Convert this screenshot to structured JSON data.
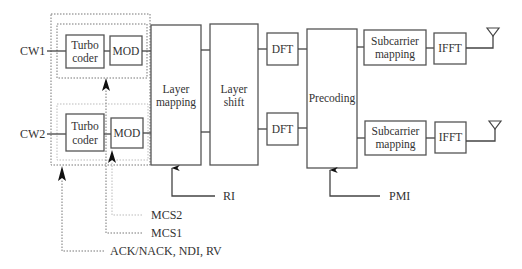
{
  "inputs": {
    "cw1": "CW1",
    "cw2": "CW2"
  },
  "blocks": {
    "turbo1": [
      "Turbo",
      "coder"
    ],
    "mod1": "MOD",
    "turbo2": [
      "Turbo",
      "coder"
    ],
    "mod2": "MOD",
    "layer_mapping": [
      "Layer",
      "mapping"
    ],
    "layer_shift": [
      "Layer",
      "shift"
    ],
    "dft1": "DFT",
    "dft2": "DFT",
    "precoding": "Precoding",
    "subcarrier1": [
      "Subcarrier",
      "mapping"
    ],
    "subcarrier2": [
      "Subcarrier",
      "mapping"
    ],
    "ifft1": "IFFT",
    "ifft2": "IFFT"
  },
  "control": {
    "ri": "RI",
    "pmi": "PMI",
    "mcs2": "MCS2",
    "mcs1": "MCS1",
    "harq": "ACK/NACK, NDI, RV"
  },
  "icons": {
    "antenna": "antenna-icon",
    "arrow": "arrow-up-icon"
  }
}
